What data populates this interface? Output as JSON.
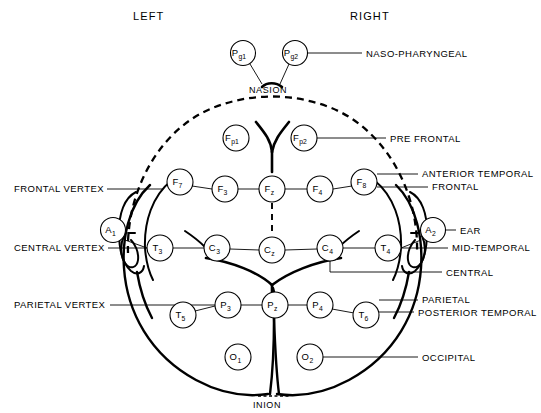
{
  "figure": {
    "orientation": {
      "left": "LEFT",
      "right": "RIGHT"
    },
    "landmarks": {
      "nasion": "NASION",
      "inion": "INION"
    },
    "colors": {
      "ink": "#000000",
      "paper": "#ffffff"
    }
  },
  "electrodes": [
    {
      "id": "Pg1",
      "letter": "P",
      "sub": "g1",
      "x": 243,
      "y": 53,
      "r": 12.5
    },
    {
      "id": "Pg2",
      "letter": "P",
      "sub": "g2",
      "x": 295,
      "y": 53,
      "r": 12.5
    },
    {
      "id": "Fp1",
      "letter": "F",
      "sub": "p1",
      "x": 236,
      "y": 138,
      "r": 13
    },
    {
      "id": "Fp2",
      "letter": "F",
      "sub": "p2",
      "x": 304,
      "y": 138,
      "r": 13
    },
    {
      "id": "F7",
      "letter": "F",
      "sub": "7",
      "x": 180,
      "y": 182,
      "r": 13
    },
    {
      "id": "F3",
      "letter": "F",
      "sub": "3",
      "x": 225,
      "y": 189,
      "r": 13
    },
    {
      "id": "Fz",
      "letter": "F",
      "sub": "z",
      "x": 272,
      "y": 189,
      "r": 13
    },
    {
      "id": "F4",
      "letter": "F",
      "sub": "4",
      "x": 320,
      "y": 189,
      "r": 13
    },
    {
      "id": "F8",
      "letter": "F",
      "sub": "8",
      "x": 364,
      "y": 182,
      "r": 13
    },
    {
      "id": "A1",
      "letter": "A",
      "sub": "1",
      "x": 113,
      "y": 230,
      "r": 12.5
    },
    {
      "id": "T3",
      "letter": "T",
      "sub": "3",
      "x": 160,
      "y": 248,
      "r": 13
    },
    {
      "id": "C3",
      "letter": "C",
      "sub": "3",
      "x": 217,
      "y": 248,
      "r": 13
    },
    {
      "id": "Cz",
      "letter": "C",
      "sub": "z",
      "x": 272,
      "y": 250,
      "r": 13
    },
    {
      "id": "C4",
      "letter": "C",
      "sub": "4",
      "x": 330,
      "y": 248,
      "r": 13
    },
    {
      "id": "T4",
      "letter": "T",
      "sub": "4",
      "x": 388,
      "y": 248,
      "r": 13
    },
    {
      "id": "A2",
      "letter": "A",
      "sub": "2",
      "x": 433,
      "y": 230,
      "r": 12.5
    },
    {
      "id": "T5",
      "letter": "T",
      "sub": "5",
      "x": 183,
      "y": 315,
      "r": 13
    },
    {
      "id": "P3",
      "letter": "P",
      "sub": "3",
      "x": 228,
      "y": 305,
      "r": 13
    },
    {
      "id": "Pz",
      "letter": "P",
      "sub": "z",
      "x": 275,
      "y": 305,
      "r": 13
    },
    {
      "id": "P4",
      "letter": "P",
      "sub": "4",
      "x": 320,
      "y": 305,
      "r": 13
    },
    {
      "id": "T6",
      "letter": "T",
      "sub": "6",
      "x": 366,
      "y": 315,
      "r": 13
    },
    {
      "id": "O1",
      "letter": "O",
      "sub": "1",
      "x": 238,
      "y": 357,
      "r": 13
    },
    {
      "id": "O2",
      "letter": "O",
      "sub": "2",
      "x": 310,
      "y": 357,
      "r": 13
    }
  ],
  "callouts_left": [
    {
      "id": "frontal-vertex",
      "label": "FRONTAL VERTEX",
      "text_x": 14,
      "text_y": 192,
      "line_x1": 107,
      "line_y1": 189,
      "line_x2": 160,
      "line_y2": 189
    },
    {
      "id": "central-vertex",
      "label": "CENTRAL VERTEX",
      "text_x": 14,
      "text_y": 251,
      "line_x1": 108,
      "line_y1": 248,
      "line_x2": 147,
      "line_y2": 248
    },
    {
      "id": "parietal-vertex",
      "label": "PARIETAL VERTEX",
      "text_x": 14,
      "text_y": 308,
      "line_x1": 110,
      "line_y1": 305,
      "line_x2": 215,
      "line_y2": 305
    }
  ],
  "callouts_right": [
    {
      "id": "naso-pharyngeal",
      "label": "NASO-PHARYNGEAL",
      "text_x": 366,
      "text_y": 57,
      "line_x1": 308,
      "line_y1": 53,
      "line_x2": 362,
      "line_y2": 53
    },
    {
      "id": "pre-frontal",
      "label": "PRE FRONTAL",
      "text_x": 390,
      "text_y": 142,
      "line_x1": 317,
      "line_y1": 138,
      "line_x2": 386,
      "line_y2": 138
    },
    {
      "id": "anterior-temporal",
      "label": "ANTERIOR TEMPORAL",
      "text_x": 422,
      "text_y": 177,
      "line_x1": 377,
      "line_y1": 174,
      "line_x2": 418,
      "line_y2": 174
    },
    {
      "id": "frontal",
      "label": "FRONTAL",
      "text_x": 432,
      "text_y": 190,
      "line_x1": 377,
      "line_y1": 187,
      "line_x2": 428,
      "line_y2": 187
    },
    {
      "id": "ear",
      "label": "EAR",
      "text_x": 460,
      "text_y": 234,
      "line_x1": 446,
      "line_y1": 230,
      "line_x2": 456,
      "line_y2": 230
    },
    {
      "id": "mid-temporal",
      "label": "MID-TEMPORAL",
      "text_x": 452,
      "text_y": 251,
      "line_x1": 401,
      "line_y1": 248,
      "line_x2": 448,
      "line_y2": 248
    },
    {
      "id": "central",
      "label": "CENTRAL",
      "text_x": 446,
      "text_y": 276,
      "line_x1": 330,
      "line_y1": 272,
      "line_x2": 442,
      "line_y2": 272
    },
    {
      "id": "parietal",
      "label": "PARIETAL",
      "text_x": 422,
      "text_y": 303,
      "line_x1": 379,
      "line_y1": 300,
      "line_x2": 418,
      "line_y2": 300
    },
    {
      "id": "posterior-temporal",
      "label": "POSTERIOR TEMPORAL",
      "text_x": 418,
      "text_y": 316,
      "line_x1": 379,
      "line_y1": 312,
      "line_x2": 414,
      "line_y2": 312
    },
    {
      "id": "occipital",
      "label": "OCCIPITAL",
      "text_x": 422,
      "text_y": 361,
      "line_x1": 323,
      "line_y1": 357,
      "line_x2": 418,
      "line_y2": 357
    }
  ],
  "header_positions": {
    "left_x": 133,
    "left_y": 20,
    "right_x": 350,
    "right_y": 20
  },
  "landmark_positions": {
    "nasion_x": 249,
    "nasion_y": 93,
    "inion_x": 253,
    "inion_y": 406
  }
}
